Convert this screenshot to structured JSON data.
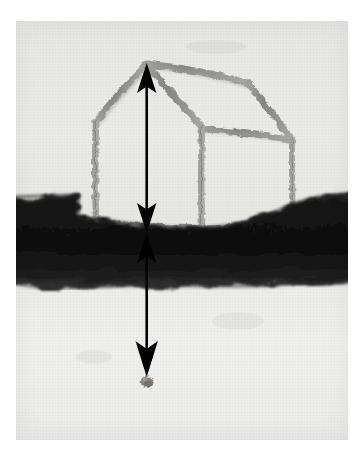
{
  "artwork": {
    "title": "House frame above ground with paired measurement arrows to buried seed",
    "medium": "charcoal and pastel drawing photographed on paper",
    "plate": {
      "left": 16,
      "top": 21,
      "width": 332,
      "height": 419,
      "paper_color": "#ffffff",
      "sky_color": "#e8e8e6",
      "subsoil_color": "#eeeeec",
      "ground_color": "#161616"
    },
    "ground_band": {
      "name": "dark soil stratum",
      "left_top_y": 192,
      "right_top_y": 196,
      "bottom_y": 278,
      "color": "#151515",
      "description": "broad near-black charcoal band spanning full width, stepping up at the left of the house and rising slightly toward the right edge"
    },
    "house": {
      "name": "sketched house frame",
      "stroke_color": "#8c8c8a",
      "apex": {
        "x": 147,
        "y": 63
      },
      "description": "open skeletal frame in perspective: gabled front face at left, ridge and right side face receding to the right, resting on the soil line",
      "parts": [
        "left roof slope",
        "right roof slope",
        "ridge line receding right",
        "front left post",
        "front right post",
        "rear right post",
        "eave beam right",
        "base sill beam"
      ]
    },
    "arrows": [
      {
        "name": "above-ground height arrow",
        "label": "",
        "heads": "double",
        "x": 147,
        "y_top": 64,
        "y_bottom": 228,
        "color": "#000000",
        "meaning": "measures the height of the house frame from roof apex down to ground level"
      },
      {
        "name": "below-ground depth arrow",
        "label": "",
        "heads": "double",
        "x": 147,
        "y_top": 228,
        "y_bottom": 374,
        "color": "#000000",
        "meaning": "measures the depth from ground level down to the buried seed"
      }
    ],
    "seed": {
      "name": "buried seed",
      "x": 147,
      "y": 381,
      "width": 13,
      "height": 12,
      "color": "#8a8580",
      "description": "small irregular gray-brown blob resting just below the lower arrow tip"
    }
  }
}
